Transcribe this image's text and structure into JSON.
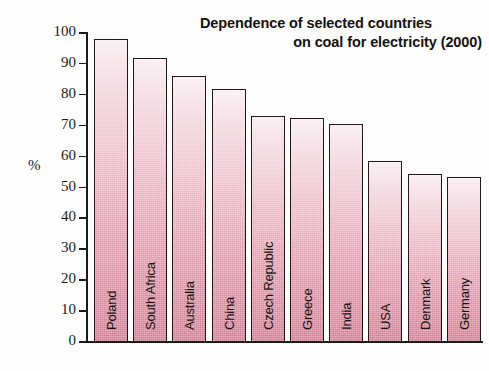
{
  "chart_data": {
    "type": "bar",
    "title": "Dependence of selected countries on coal for electricity (2000)",
    "title_line1": "Dependence of selected countries",
    "title_line2": "on coal for electricity (2000)",
    "xlabel": "",
    "ylabel": "%",
    "ylim": [
      0,
      100
    ],
    "grid": false,
    "legend": null,
    "ytick_labels": [
      "100",
      "90",
      "80",
      "70",
      "60",
      "50",
      "40",
      "30",
      "20",
      "10",
      "0"
    ],
    "ytick_values": [
      100,
      90,
      80,
      70,
      60,
      50,
      40,
      30,
      20,
      10,
      0
    ],
    "categories": [
      "Poland",
      "South Africa",
      "Australia",
      "China",
      "Czech Republic",
      "Greece",
      "India",
      "USA",
      "Denmark",
      "Germany"
    ],
    "values": [
      98,
      92,
      86,
      82,
      73,
      72.5,
      70.5,
      58.5,
      54.5,
      53.5
    ],
    "bar_color_top": "#faeef1",
    "bar_color_bottom": "#cf7e93",
    "bar_border_color": "#231815",
    "bar_shadow_color": "#8a93a8",
    "background_color": "#fdfdfd",
    "axis_color": "#1a1a1a"
  }
}
